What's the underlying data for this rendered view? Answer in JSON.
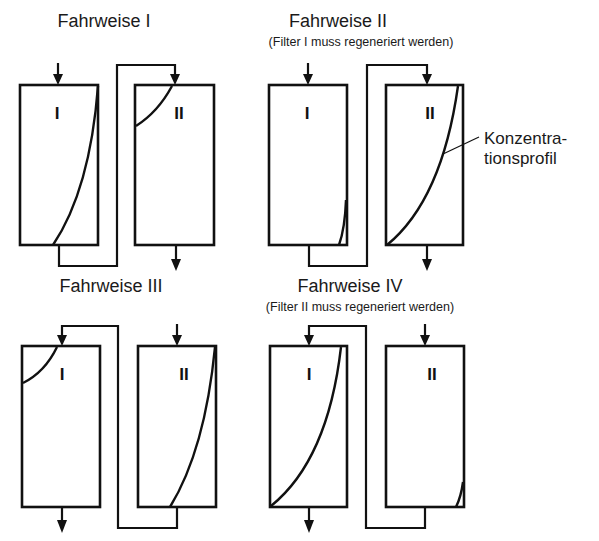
{
  "diagram": {
    "type": "filter-series-operating-modes",
    "annotation": {
      "line1": "Konzentra-",
      "line2": "tionsprofil",
      "full": "Konzentrationsprofil"
    },
    "panels": [
      {
        "id": "fahrweise-1",
        "title": "Fahrweise I",
        "subtitle": "",
        "flow": "I -> II",
        "filters": [
          {
            "label": "I",
            "loading": "high"
          },
          {
            "label": "II",
            "loading": "low"
          }
        ]
      },
      {
        "id": "fahrweise-2",
        "title": "Fahrweise II",
        "subtitle": "(Filter I muss regeneriert werden)",
        "flow": "I -> II",
        "filters": [
          {
            "label": "I",
            "loading": "saturated"
          },
          {
            "label": "II",
            "loading": "high"
          }
        ]
      },
      {
        "id": "fahrweise-3",
        "title": "Fahrweise III",
        "subtitle": "",
        "flow": "II -> I",
        "filters": [
          {
            "label": "I",
            "loading": "low"
          },
          {
            "label": "II",
            "loading": "high"
          }
        ]
      },
      {
        "id": "fahrweise-4",
        "title": "Fahrweise IV",
        "subtitle": "(Filter II muss regeneriert werden)",
        "flow": "II -> I",
        "filters": [
          {
            "label": "I",
            "loading": "high"
          },
          {
            "label": "II",
            "loading": "saturated"
          }
        ]
      }
    ]
  }
}
